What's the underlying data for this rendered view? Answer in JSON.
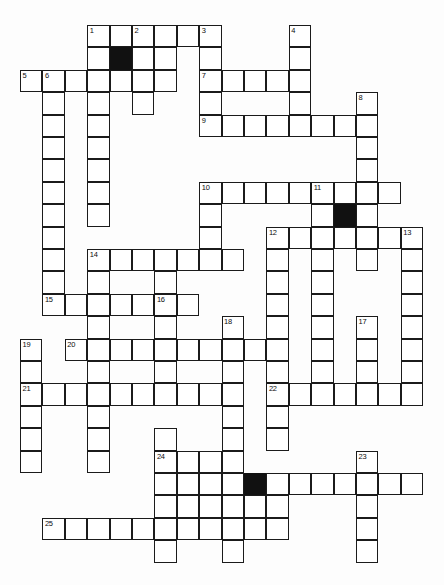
{
  "puzzle": {
    "title": "Crossword Grid",
    "type": "crossword",
    "origin_x": 20,
    "origin_y": 25,
    "cell_size": 22.4,
    "columns": 18,
    "rows": 25,
    "colors": {
      "grid_line": "#1b1b1b",
      "cell_fill": "#ffffff",
      "blocked_fill": "#111111",
      "page_background": "#fdfdfd",
      "number_text": "#0d0d0d"
    },
    "counts": {
      "numbered_clues": 25,
      "blocked_cells": 3
    },
    "numbers": [
      {
        "n": 1,
        "col": 3,
        "row": 0
      },
      {
        "n": 2,
        "col": 5,
        "row": 0
      },
      {
        "n": 3,
        "col": 8,
        "row": 0
      },
      {
        "n": 4,
        "col": 12,
        "row": 0
      },
      {
        "n": 5,
        "col": 0,
        "row": 2
      },
      {
        "n": 6,
        "col": 1,
        "row": 2
      },
      {
        "n": 7,
        "col": 8,
        "row": 2
      },
      {
        "n": 8,
        "col": 15,
        "row": 3
      },
      {
        "n": 9,
        "col": 8,
        "row": 4
      },
      {
        "n": 10,
        "col": 8,
        "row": 7
      },
      {
        "n": 11,
        "col": 13,
        "row": 7
      },
      {
        "n": 12,
        "col": 11,
        "row": 9
      },
      {
        "n": 13,
        "col": 17,
        "row": 9
      },
      {
        "n": 14,
        "col": 3,
        "row": 10
      },
      {
        "n": 15,
        "col": 1,
        "row": 12
      },
      {
        "n": 16,
        "col": 6,
        "row": 12
      },
      {
        "n": 17,
        "col": 15,
        "row": 13
      },
      {
        "n": 18,
        "col": 9,
        "row": 13
      },
      {
        "n": 19,
        "col": 0,
        "row": 14
      },
      {
        "n": 20,
        "col": 2,
        "row": 14
      },
      {
        "n": 21,
        "col": 0,
        "row": 16
      },
      {
        "n": 22,
        "col": 11,
        "row": 16
      },
      {
        "n": 23,
        "col": 15,
        "row": 19
      },
      {
        "n": 24,
        "col": 6,
        "row": 19
      },
      {
        "n": 25,
        "col": 1,
        "row": 22
      }
    ],
    "blocked": [
      {
        "col": 4,
        "row": 1
      },
      {
        "col": 14,
        "row": 8
      },
      {
        "col": 10,
        "row": 20
      }
    ],
    "cells": [
      {
        "col": 3,
        "row": 0
      },
      {
        "col": 4,
        "row": 0
      },
      {
        "col": 5,
        "row": 0
      },
      {
        "col": 6,
        "row": 0
      },
      {
        "col": 7,
        "row": 0
      },
      {
        "col": 8,
        "row": 0
      },
      {
        "col": 12,
        "row": 0
      },
      {
        "col": 3,
        "row": 1
      },
      {
        "col": 4,
        "row": 1
      },
      {
        "col": 5,
        "row": 1
      },
      {
        "col": 6,
        "row": 1
      },
      {
        "col": 8,
        "row": 1
      },
      {
        "col": 12,
        "row": 1
      },
      {
        "col": 0,
        "row": 2
      },
      {
        "col": 1,
        "row": 2
      },
      {
        "col": 2,
        "row": 2
      },
      {
        "col": 3,
        "row": 2
      },
      {
        "col": 4,
        "row": 2
      },
      {
        "col": 5,
        "row": 2
      },
      {
        "col": 6,
        "row": 2
      },
      {
        "col": 8,
        "row": 2
      },
      {
        "col": 9,
        "row": 2
      },
      {
        "col": 10,
        "row": 2
      },
      {
        "col": 11,
        "row": 2
      },
      {
        "col": 12,
        "row": 2
      },
      {
        "col": 1,
        "row": 3
      },
      {
        "col": 3,
        "row": 3
      },
      {
        "col": 5,
        "row": 3
      },
      {
        "col": 8,
        "row": 3
      },
      {
        "col": 12,
        "row": 3
      },
      {
        "col": 15,
        "row": 3
      },
      {
        "col": 1,
        "row": 4
      },
      {
        "col": 3,
        "row": 4
      },
      {
        "col": 8,
        "row": 4
      },
      {
        "col": 9,
        "row": 4
      },
      {
        "col": 10,
        "row": 4
      },
      {
        "col": 11,
        "row": 4
      },
      {
        "col": 12,
        "row": 4
      },
      {
        "col": 13,
        "row": 4
      },
      {
        "col": 14,
        "row": 4
      },
      {
        "col": 15,
        "row": 4
      },
      {
        "col": 1,
        "row": 5
      },
      {
        "col": 3,
        "row": 5
      },
      {
        "col": 15,
        "row": 5
      },
      {
        "col": 1,
        "row": 6
      },
      {
        "col": 3,
        "row": 6
      },
      {
        "col": 15,
        "row": 6
      },
      {
        "col": 1,
        "row": 7
      },
      {
        "col": 3,
        "row": 7
      },
      {
        "col": 8,
        "row": 7
      },
      {
        "col": 9,
        "row": 7
      },
      {
        "col": 10,
        "row": 7
      },
      {
        "col": 11,
        "row": 7
      },
      {
        "col": 12,
        "row": 7
      },
      {
        "col": 13,
        "row": 7
      },
      {
        "col": 14,
        "row": 7
      },
      {
        "col": 15,
        "row": 7
      },
      {
        "col": 16,
        "row": 7
      },
      {
        "col": 1,
        "row": 8
      },
      {
        "col": 3,
        "row": 8
      },
      {
        "col": 8,
        "row": 8
      },
      {
        "col": 13,
        "row": 8
      },
      {
        "col": 14,
        "row": 8
      },
      {
        "col": 15,
        "row": 8
      },
      {
        "col": 1,
        "row": 9
      },
      {
        "col": 8,
        "row": 9
      },
      {
        "col": 11,
        "row": 9
      },
      {
        "col": 12,
        "row": 9
      },
      {
        "col": 13,
        "row": 9
      },
      {
        "col": 14,
        "row": 9
      },
      {
        "col": 15,
        "row": 9
      },
      {
        "col": 16,
        "row": 9
      },
      {
        "col": 17,
        "row": 9
      },
      {
        "col": 1,
        "row": 10
      },
      {
        "col": 3,
        "row": 10
      },
      {
        "col": 4,
        "row": 10
      },
      {
        "col": 5,
        "row": 10
      },
      {
        "col": 6,
        "row": 10
      },
      {
        "col": 7,
        "row": 10
      },
      {
        "col": 8,
        "row": 10
      },
      {
        "col": 9,
        "row": 10
      },
      {
        "col": 11,
        "row": 10
      },
      {
        "col": 13,
        "row": 10
      },
      {
        "col": 15,
        "row": 10
      },
      {
        "col": 17,
        "row": 10
      },
      {
        "col": 1,
        "row": 11
      },
      {
        "col": 3,
        "row": 11
      },
      {
        "col": 6,
        "row": 11
      },
      {
        "col": 11,
        "row": 11
      },
      {
        "col": 13,
        "row": 11
      },
      {
        "col": 17,
        "row": 11
      },
      {
        "col": 1,
        "row": 12
      },
      {
        "col": 2,
        "row": 12
      },
      {
        "col": 3,
        "row": 12
      },
      {
        "col": 4,
        "row": 12
      },
      {
        "col": 5,
        "row": 12
      },
      {
        "col": 6,
        "row": 12
      },
      {
        "col": 7,
        "row": 12
      },
      {
        "col": 11,
        "row": 12
      },
      {
        "col": 13,
        "row": 12
      },
      {
        "col": 17,
        "row": 12
      },
      {
        "col": 3,
        "row": 13
      },
      {
        "col": 6,
        "row": 13
      },
      {
        "col": 9,
        "row": 13
      },
      {
        "col": 11,
        "row": 13
      },
      {
        "col": 13,
        "row": 13
      },
      {
        "col": 15,
        "row": 13
      },
      {
        "col": 17,
        "row": 13
      },
      {
        "col": 0,
        "row": 14
      },
      {
        "col": 2,
        "row": 14
      },
      {
        "col": 3,
        "row": 14
      },
      {
        "col": 4,
        "row": 14
      },
      {
        "col": 5,
        "row": 14
      },
      {
        "col": 6,
        "row": 14
      },
      {
        "col": 7,
        "row": 14
      },
      {
        "col": 8,
        "row": 14
      },
      {
        "col": 9,
        "row": 14
      },
      {
        "col": 10,
        "row": 14
      },
      {
        "col": 11,
        "row": 14
      },
      {
        "col": 13,
        "row": 14
      },
      {
        "col": 15,
        "row": 14
      },
      {
        "col": 17,
        "row": 14
      },
      {
        "col": 0,
        "row": 15
      },
      {
        "col": 3,
        "row": 15
      },
      {
        "col": 6,
        "row": 15
      },
      {
        "col": 9,
        "row": 15
      },
      {
        "col": 11,
        "row": 15
      },
      {
        "col": 13,
        "row": 15
      },
      {
        "col": 15,
        "row": 15
      },
      {
        "col": 17,
        "row": 15
      },
      {
        "col": 0,
        "row": 16
      },
      {
        "col": 1,
        "row": 16
      },
      {
        "col": 2,
        "row": 16
      },
      {
        "col": 3,
        "row": 16
      },
      {
        "col": 4,
        "row": 16
      },
      {
        "col": 5,
        "row": 16
      },
      {
        "col": 6,
        "row": 16
      },
      {
        "col": 7,
        "row": 16
      },
      {
        "col": 8,
        "row": 16
      },
      {
        "col": 9,
        "row": 16
      },
      {
        "col": 11,
        "row": 16
      },
      {
        "col": 12,
        "row": 16
      },
      {
        "col": 13,
        "row": 16
      },
      {
        "col": 14,
        "row": 16
      },
      {
        "col": 15,
        "row": 16
      },
      {
        "col": 16,
        "row": 16
      },
      {
        "col": 17,
        "row": 16
      },
      {
        "col": 0,
        "row": 17
      },
      {
        "col": 3,
        "row": 17
      },
      {
        "col": 9,
        "row": 17
      },
      {
        "col": 11,
        "row": 17
      },
      {
        "col": 0,
        "row": 18
      },
      {
        "col": 3,
        "row": 18
      },
      {
        "col": 6,
        "row": 18
      },
      {
        "col": 9,
        "row": 18
      },
      {
        "col": 11,
        "row": 18
      },
      {
        "col": 0,
        "row": 19
      },
      {
        "col": 3,
        "row": 19
      },
      {
        "col": 6,
        "row": 19
      },
      {
        "col": 7,
        "row": 19
      },
      {
        "col": 8,
        "row": 19
      },
      {
        "col": 9,
        "row": 19
      },
      {
        "col": 15,
        "row": 19
      },
      {
        "col": 6,
        "row": 20
      },
      {
        "col": 7,
        "row": 20
      },
      {
        "col": 8,
        "row": 20
      },
      {
        "col": 9,
        "row": 20
      },
      {
        "col": 10,
        "row": 20
      },
      {
        "col": 11,
        "row": 20
      },
      {
        "col": 12,
        "row": 20
      },
      {
        "col": 13,
        "row": 20
      },
      {
        "col": 14,
        "row": 20
      },
      {
        "col": 15,
        "row": 20
      },
      {
        "col": 16,
        "row": 20
      },
      {
        "col": 17,
        "row": 20
      },
      {
        "col": 6,
        "row": 21
      },
      {
        "col": 7,
        "row": 21
      },
      {
        "col": 8,
        "row": 21
      },
      {
        "col": 9,
        "row": 21
      },
      {
        "col": 10,
        "row": 21
      },
      {
        "col": 11,
        "row": 21
      },
      {
        "col": 15,
        "row": 21
      },
      {
        "col": 1,
        "row": 22
      },
      {
        "col": 2,
        "row": 22
      },
      {
        "col": 3,
        "row": 22
      },
      {
        "col": 4,
        "row": 22
      },
      {
        "col": 5,
        "row": 22
      },
      {
        "col": 6,
        "row": 22
      },
      {
        "col": 7,
        "row": 22
      },
      {
        "col": 8,
        "row": 22
      },
      {
        "col": 9,
        "row": 22
      },
      {
        "col": 10,
        "row": 22
      },
      {
        "col": 11,
        "row": 22
      },
      {
        "col": 15,
        "row": 22
      },
      {
        "col": 6,
        "row": 23
      },
      {
        "col": 9,
        "row": 23
      },
      {
        "col": 15,
        "row": 23
      }
    ]
  }
}
